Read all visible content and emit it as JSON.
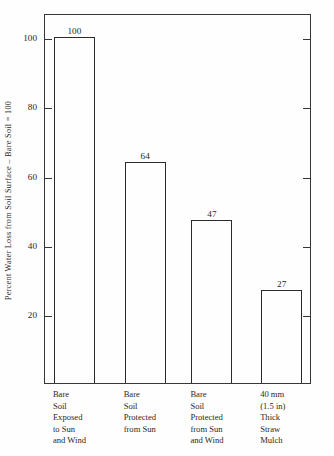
{
  "chart_data": {
    "type": "bar",
    "title": "",
    "xlabel": "",
    "ylabel": "Percent Water Loss from Soil Surface  –  Bare Soil  =  100",
    "categories": [
      "Bare Soil Exposed to Sun and Wind",
      "Bare Soil Protected from Sun",
      "Bare Soil Protected from Sun and Wind",
      "40 mm (1.5 in) Thick Straw Mulch"
    ],
    "category_lines": [
      [
        "Bare",
        "Soil",
        "Exposed",
        "to Sun",
        "and Wind"
      ],
      [
        "Bare",
        "Soil",
        "Protected",
        "from Sun"
      ],
      [
        "Bare",
        "Soil",
        "Protected",
        "from Sun",
        "and Wind"
      ],
      [
        "40 mm",
        "(1.5 in)",
        "Thick",
        "Straw",
        "Mulch"
      ]
    ],
    "values": [
      100,
      64,
      47,
      27
    ],
    "value_labels": [
      "100",
      "64",
      "47",
      "27"
    ],
    "ylim": [
      0,
      107
    ],
    "yticks": [
      20,
      40,
      60,
      80,
      100
    ],
    "ytick_labels": [
      "20",
      "40",
      "60",
      "80",
      "100"
    ],
    "grid": false,
    "legend": null,
    "bar_fill": "none",
    "bar_edge_color": "#2e2a27",
    "axis_color": "#3a3633",
    "text_color": "#2b2724",
    "background_color": "#ffffff"
  }
}
